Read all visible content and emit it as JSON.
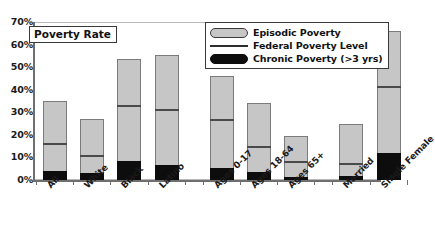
{
  "chart_data": {
    "type": "bar",
    "title": "",
    "xlabel": "",
    "ylabel": "Poverty Rate",
    "ylim": [
      0,
      70
    ],
    "ytick_labels": [
      "70%",
      "60%",
      "50%",
      "40%",
      "30%",
      "20%",
      "10%",
      "0%"
    ],
    "ytick_values": [
      70,
      60,
      50,
      40,
      30,
      20,
      10,
      0
    ],
    "grid": false,
    "legend_position": "top-right",
    "categories": [
      "All",
      "White",
      "Black",
      "Latino",
      "Ages 0-17",
      "Ages 18-64",
      "Ages 65+",
      "Married",
      "Single Female"
    ],
    "group_gap_after": [
      "Latino",
      "Ages 65+"
    ],
    "series": [
      {
        "name": "Episodic Poverty",
        "values": [
          35,
          27,
          53.5,
          55.5,
          46,
          34,
          19.5,
          25,
          66
        ]
      },
      {
        "name": "Federal Poverty Level",
        "values": [
          16,
          10.5,
          33,
          31,
          26.5,
          14.5,
          8,
          7,
          41
        ]
      },
      {
        "name": "Chronic Poverty (>3 yrs)",
        "values": [
          4,
          3,
          8.5,
          6.5,
          5.5,
          3.5,
          1.5,
          2,
          12
        ]
      }
    ],
    "colors": {
      "episodic": "#c6c6c6",
      "episodic_border": "#7b7b7b",
      "federal_line": "#4a4a4a",
      "chronic": "#0d0d0d",
      "axis": "#6f6f6f",
      "text": "#1a1a1a"
    }
  },
  "legend": {
    "items": [
      {
        "label": "Episodic Poverty",
        "icon": "rounded-gray-swatch-icon"
      },
      {
        "label": "Federal Poverty Level",
        "icon": "horizontal-line-swatch-icon"
      },
      {
        "label": "Chronic Poverty (>3 yrs)",
        "icon": "rounded-black-swatch-icon"
      }
    ]
  },
  "axis_title": {
    "y": "Poverty Rate"
  }
}
